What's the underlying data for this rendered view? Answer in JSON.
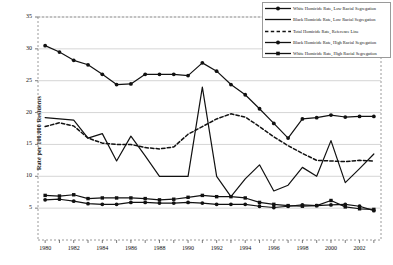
{
  "chart_data": {
    "type": "line",
    "title": "",
    "xlabel": "",
    "ylabel": "Rate per 100,000 Residents",
    "xlim": [
      1979.5,
      2003.5
    ],
    "ylim": [
      0,
      35
    ],
    "yticks": [
      5,
      10,
      15,
      20,
      25,
      30,
      35
    ],
    "xticks": [
      1980,
      1982,
      1984,
      1986,
      1988,
      1990,
      1992,
      1994,
      1996,
      1998,
      2000,
      2002
    ],
    "grid": "horizontal",
    "legend_position": "top-right",
    "x": [
      1980,
      1981,
      1982,
      1983,
      1984,
      1985,
      1986,
      1987,
      1988,
      1989,
      1990,
      1991,
      1992,
      1993,
      1994,
      1995,
      1996,
      1997,
      1998,
      1999,
      2000,
      2001,
      2002,
      2003
    ],
    "series": [
      {
        "name": "White Homicide Rate, Low Racial Segregation",
        "marker": "circle",
        "dash": false,
        "values": [
          6.3,
          6.4,
          6.1,
          5.7,
          5.6,
          5.6,
          5.9,
          5.9,
          5.8,
          5.8,
          5.9,
          5.8,
          5.6,
          5.6,
          5.6,
          5.3,
          5.1,
          5.3,
          5.5,
          5.4,
          5.5,
          5.6,
          5.3,
          4.6
        ]
      },
      {
        "name": "Black Homicide Rate, Low Racial Segregation",
        "marker": "none",
        "dash": false,
        "values": [
          19.2,
          19.0,
          18.8,
          16.0,
          16.7,
          12.4,
          16.3,
          13.2,
          10.0,
          10.0,
          10.0,
          24.0,
          10.0,
          6.8,
          9.6,
          11.8,
          7.7,
          8.6,
          11.4,
          10.0,
          15.6,
          9.0,
          11.2,
          13.5
        ]
      },
      {
        "name": "Total Homicide Rate, Reference Line",
        "marker": "none",
        "dash": true,
        "values": [
          17.8,
          18.4,
          17.9,
          16.0,
          15.2,
          15.0,
          15.0,
          14.5,
          14.3,
          14.6,
          16.6,
          17.8,
          19.0,
          19.8,
          19.3,
          17.8,
          16.2,
          14.8,
          13.6,
          12.5,
          12.4,
          12.3,
          12.5,
          12.4
        ]
      },
      {
        "name": "Black Homicide Rate, High Racial Segregation",
        "marker": "circle",
        "dash": false,
        "values": [
          30.5,
          29.5,
          28.2,
          27.5,
          26.0,
          24.4,
          24.5,
          26.0,
          26.0,
          26.0,
          25.8,
          27.8,
          26.5,
          24.4,
          22.8,
          20.6,
          18.3,
          16.0,
          19.0,
          19.2,
          19.6,
          19.3,
          19.4,
          19.4
        ]
      },
      {
        "name": "White Homicide Rate, High Racial Segregation",
        "marker": "square",
        "dash": false,
        "values": [
          7.0,
          6.9,
          7.1,
          6.5,
          6.6,
          6.6,
          6.6,
          6.5,
          6.3,
          6.4,
          6.7,
          7.0,
          6.8,
          6.8,
          6.6,
          5.9,
          5.6,
          5.4,
          5.3,
          5.4,
          6.2,
          5.2,
          4.9,
          4.8
        ]
      }
    ]
  },
  "axis": {
    "ylabel": "Rate per 100,000 Residents",
    "yticks": [
      "35",
      "30",
      "25",
      "20",
      "15",
      "10",
      "5"
    ],
    "xticks": [
      "1980",
      "1982",
      "1984",
      "1986",
      "1988",
      "1990",
      "1992",
      "1994",
      "1996",
      "1998",
      "2000",
      "2002"
    ]
  },
  "legend": {
    "items": [
      {
        "label": "White Homicide Rate, Low Racial Segregation",
        "icon": "line-circle-marker-icon"
      },
      {
        "label": "Black Homicide Rate, Low Racial Segregation",
        "icon": "line-plain-icon"
      },
      {
        "label": "Total Homicide Rate, Reference Line",
        "icon": "line-dashed-icon"
      },
      {
        "label": "Black Homicide Rate, High Racial Segregation",
        "icon": "line-circle-marker-icon"
      },
      {
        "label": "White Homicide Rate, High Racial Segregation",
        "icon": "line-square-marker-icon"
      }
    ]
  },
  "colors": {
    "ink": "#111111",
    "grid": "#b9b9b9",
    "frame": "#9a9a9a"
  }
}
